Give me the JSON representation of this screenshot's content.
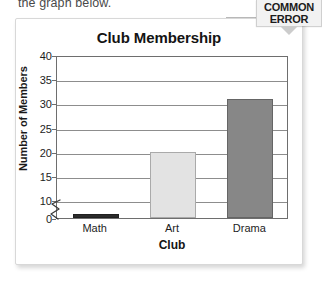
{
  "lead_in_text": "the graph below.",
  "badge": {
    "line1": "COMMON",
    "line2": "ERROR"
  },
  "chart_data": {
    "type": "bar",
    "title": "Club Membership",
    "xlabel": "Club",
    "ylabel": "Number of Members",
    "categories": [
      "Math",
      "Art",
      "Drama"
    ],
    "values": [
      2,
      20,
      31
    ],
    "series": [
      {
        "name": "Number of Members",
        "values": [
          2,
          20,
          31
        ],
        "colors": [
          "#2b2b2b",
          "#e3e3e3",
          "#878787"
        ]
      }
    ],
    "ylim": [
      0,
      40
    ],
    "yticks": [
      0,
      10,
      15,
      20,
      25,
      30,
      35,
      40
    ],
    "ytick_labels": [
      "0",
      "10",
      "15",
      "20",
      "25",
      "30",
      "35",
      "40"
    ],
    "grid": "horizontal",
    "legend": "none",
    "axis_break": {
      "present": true,
      "between": [
        0,
        10
      ],
      "note": "broken y-axis between 0 and 10"
    },
    "bar_colors": {
      "math": "#2b2b2b",
      "art": "#e3e3e3",
      "drama": "#878787"
    }
  },
  "colors": {
    "card_background": "#ffffff",
    "card_border": "#d8d8d8",
    "axis": "#6e6e6e",
    "gridline": "#8d8d8d",
    "badge_background": "#f2f2f2",
    "badge_tail": "#cccccc",
    "text": "#1d1d1d"
  }
}
